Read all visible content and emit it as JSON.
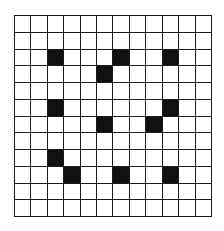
{
  "grid": {
    "rows": 12,
    "cols": 12,
    "fill_color": "#111111",
    "line_color": "#1a1a1a",
    "background": "#ffffff",
    "filled_cells": [
      [
        2,
        2
      ],
      [
        2,
        6
      ],
      [
        2,
        9
      ],
      [
        3,
        5
      ],
      [
        5,
        2
      ],
      [
        5,
        9
      ],
      [
        6,
        5
      ],
      [
        6,
        8
      ],
      [
        8,
        2
      ],
      [
        9,
        3
      ],
      [
        9,
        6
      ],
      [
        9,
        9
      ]
    ]
  }
}
